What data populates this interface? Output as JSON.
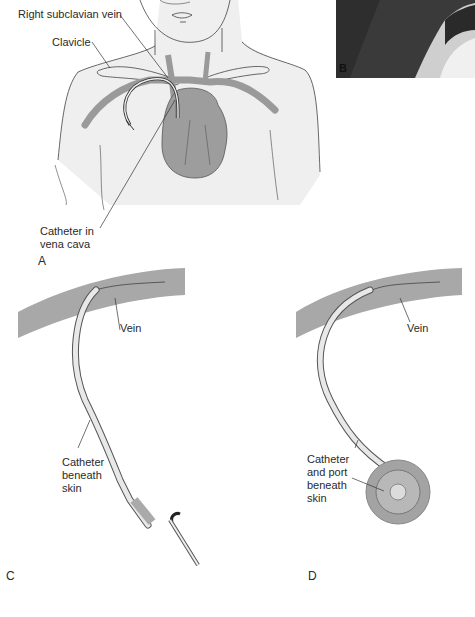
{
  "figure": {
    "panels": [
      {
        "id": "A",
        "letter": "A",
        "description": "Torso illustration with catheter inserted via right subclavian vein into vena cava"
      },
      {
        "id": "B",
        "letter": "B",
        "description": "Photograph of catheter site"
      },
      {
        "id": "C",
        "letter": "C",
        "description": "Tunneled catheter beneath skin entering vein"
      },
      {
        "id": "D",
        "letter": "D",
        "description": "Implanted port with catheter beneath skin entering vein"
      }
    ],
    "labels": {
      "a_subclavian": "Right subclavian vein",
      "a_clavicle": "Clavicle",
      "a_catheter": "Catheter in\nvena cava",
      "c_vein": "Vein",
      "c_catheter": "Catheter\nbeneath\nskin",
      "d_vein": "Vein",
      "d_catheter": "Catheter\nand port\nbeneath\nskin"
    },
    "colors": {
      "skin": "#efefef",
      "vessel": "#9a9a9a",
      "heart": "#9d9d9d",
      "vein_band": "#a8a8a8",
      "catheter": "#e8e8e8",
      "photo_dark": "#3a3a3a",
      "line": "#333333"
    }
  }
}
